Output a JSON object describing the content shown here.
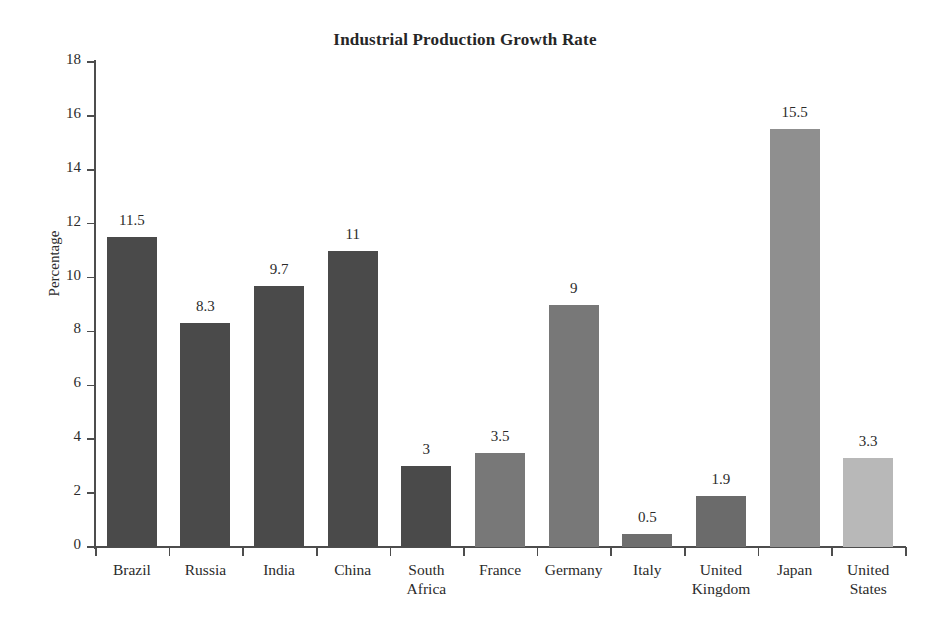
{
  "chart_data": {
    "type": "bar",
    "title": "Industrial Production Growth Rate",
    "xlabel": "",
    "ylabel": "Percentage",
    "ylim": [
      0,
      18
    ],
    "ytick_step": 2,
    "yticks": [
      18,
      16,
      14,
      12,
      10,
      8,
      6,
      4,
      2,
      0
    ],
    "grid": false,
    "legend": "none",
    "categories": [
      "Brazil",
      "Russia",
      "India",
      "China",
      "South\nAfrica",
      "France",
      "Germany",
      "Italy",
      "United\nKingdom",
      "Japan",
      "United\nStates"
    ],
    "values": [
      11.5,
      8.3,
      9.7,
      11,
      3,
      3.5,
      9,
      0.5,
      1.9,
      15.5,
      3.3
    ],
    "value_labels": [
      "11.5",
      "8.3",
      "9.7",
      "11",
      "3",
      "3.5",
      "9",
      "0.5",
      "1.9",
      "15.5",
      "3.3"
    ],
    "bar_colors": [
      "#4a4a4a",
      "#4a4a4a",
      "#4a4a4a",
      "#4a4a4a",
      "#4a4a4a",
      "#787878",
      "#787878",
      "#6e6e6e",
      "#6b6b6b",
      "#8f8f8f",
      "#b8b8b8"
    ],
    "axis_color": "#4d4d4d",
    "text_color": "#2b2b2b",
    "background": "#ffffff"
  }
}
